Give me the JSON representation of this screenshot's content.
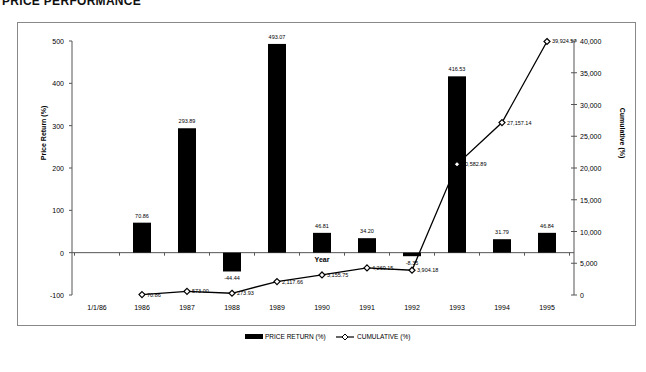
{
  "title": "PRICE PERFORMANCE",
  "legend": {
    "bar_label": "PRICE RETURN (%)",
    "line_label": "CUMULATIVE (%)"
  },
  "axes": {
    "x_title": "Year",
    "y_left_title": "Price Return (%)",
    "y_right_title": "Cumulative (%)",
    "y_left_ticks": [
      "500",
      "400",
      "300",
      "200",
      "100",
      "0",
      "-100"
    ],
    "y_right_ticks": [
      "40,000",
      "35,000",
      "30,000",
      "25,000",
      "20,000",
      "15,000",
      "10,000",
      "5,000",
      "0"
    ]
  },
  "chart_data": {
    "type": "bar",
    "title": "PRICE PERFORMANCE",
    "xlabel": "Year",
    "ylabel": "Price Return (%)",
    "y2label": "Cumulative (%)",
    "ylim": [
      -100,
      500
    ],
    "y2lim": [
      0,
      40000
    ],
    "grid": false,
    "legend_position": "bottom",
    "categories": [
      "1/1/86",
      "1986",
      "1987",
      "1988",
      "1989",
      "1990",
      "1991",
      "1992",
      "1993",
      "1994",
      "1995"
    ],
    "series": [
      {
        "name": "PRICE RETURN (%)",
        "type": "bar",
        "axis": "left",
        "values": [
          null,
          70.86,
          293.89,
          -44.44,
          493.07,
          46.81,
          34.2,
          -8.35,
          416.53,
          31.79,
          46.84
        ],
        "labels": [
          "",
          "70.86",
          "293.89",
          "-44.44",
          "493.07",
          "46.81",
          "34.20",
          "-8.35",
          "416.53",
          "31.79",
          "46.84"
        ]
      },
      {
        "name": "CUMULATIVE (%)",
        "type": "line",
        "axis": "right",
        "values": [
          null,
          70.86,
          573.0,
          273.93,
          2117.66,
          3155.75,
          4269.15,
          3904.18,
          20582.89,
          27157.14,
          39924.57
        ],
        "labels": [
          "",
          "70.86",
          "573.00",
          "273.93",
          "2,117.66",
          "3,155.75",
          "4,269.15",
          "3,904.18",
          "20,582.89",
          "27,157.14",
          "39,924.57"
        ]
      }
    ]
  }
}
